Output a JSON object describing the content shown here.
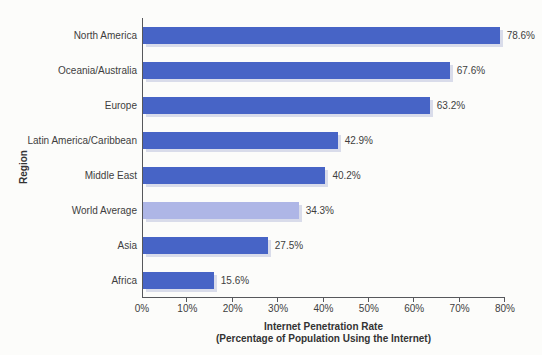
{
  "chart_data": {
    "type": "bar",
    "orientation": "horizontal",
    "title": "",
    "xlabel_line1": "Internet Penetration Rate",
    "xlabel_line2": "(Percentage of Population Using the Internet)",
    "ylabel": "Region",
    "categories": [
      "North America",
      "Oceania/Australia",
      "Europe",
      "Latin America/Caribbean",
      "Middle East",
      "World Average",
      "Asia",
      "Africa"
    ],
    "values": [
      78.6,
      67.6,
      63.2,
      42.9,
      40.2,
      34.3,
      27.5,
      15.6
    ],
    "value_labels": [
      "78.6%",
      "67.6%",
      "63.2%",
      "42.9%",
      "40.2%",
      "34.3%",
      "27.5%",
      "15.6%"
    ],
    "highlight_category": "World Average",
    "xlim": [
      0,
      80
    ],
    "x_ticks": [
      "0%",
      "10%",
      "20%",
      "30%",
      "40%",
      "50%",
      "60%",
      "70%",
      "80%"
    ],
    "grid": false,
    "legend": "none",
    "colors": {
      "bar": "#4764C6",
      "highlight_bar": "#AEB6E6",
      "bar_shadow": "#D9DCEA",
      "axis": "#56575B",
      "text": "#3E3E3E",
      "title_text": "#333333",
      "background": "#FCFCFA"
    }
  }
}
